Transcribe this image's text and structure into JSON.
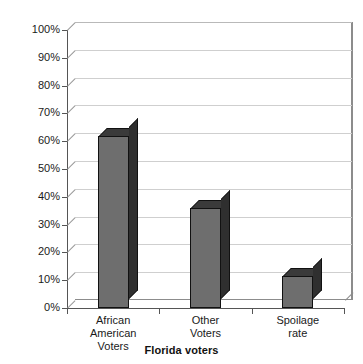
{
  "chart_data": {
    "type": "bar",
    "title": "",
    "subtitle": "",
    "xlabel": "Florida voters",
    "ylabel": "",
    "categories": [
      "African American Voters",
      "Other Voters",
      "Spoilage rate"
    ],
    "values": [
      62,
      36,
      11.5
    ],
    "ylim": [
      0,
      100
    ],
    "ytick_labels": [
      "0%",
      "10%",
      "20%",
      "30%",
      "40%",
      "50%",
      "60%",
      "70%",
      "80%",
      "90%",
      "100%"
    ],
    "ytick_values": [
      0,
      10,
      20,
      30,
      40,
      50,
      60,
      70,
      80,
      90,
      100
    ],
    "grid": true,
    "legend": "none",
    "style": "3d-column",
    "series": [
      {
        "name": "Florida voters",
        "values": [
          62,
          36,
          11.5
        ]
      }
    ],
    "colors": {
      "bar_front": "#6e6e6e",
      "bar_side": "#2f2f2f",
      "bar_top": "#3a3a3a",
      "bar_outline": "#111111",
      "gridline": "#cfcfcf",
      "axis": "#555555",
      "wall": "#8c8c8c",
      "background": "#ffffff",
      "text": "#1a1a1a"
    }
  },
  "labels": {
    "categories_lines": [
      [
        "African",
        "American",
        "Voters"
      ],
      [
        "Other",
        "Voters"
      ],
      [
        "Spoilage",
        "rate"
      ]
    ]
  }
}
